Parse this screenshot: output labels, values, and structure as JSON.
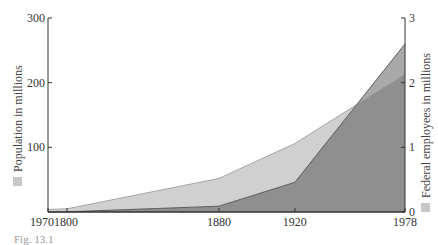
{
  "chart_data": {
    "type": "area",
    "title": "",
    "xlabel": "",
    "x_tick_labels": [
      "1970",
      "1800",
      "1880",
      "1920",
      "1978"
    ],
    "x": [
      1790,
      1800,
      1880,
      1920,
      1978
    ],
    "xlim": [
      1790,
      1978
    ],
    "y_left": {
      "label": "Population in millions",
      "ticks": [
        0,
        100,
        200,
        300
      ],
      "tick_labels": [
        "",
        "100",
        "200",
        "300"
      ],
      "ylim": [
        0,
        300
      ]
    },
    "y_right": {
      "label": "Federal employees in millions",
      "ticks": [
        0,
        1,
        2,
        3
      ],
      "tick_labels": [
        "0",
        "1",
        "2",
        "3"
      ],
      "ylim": [
        0,
        3
      ]
    },
    "series": [
      {
        "name": "Population in millions",
        "axis": "left",
        "values": [
          4,
          5,
          52,
          106,
          213
        ],
        "color": "#d0d0d0"
      },
      {
        "name": "Federal employees in millions",
        "axis": "right",
        "values": [
          0.0,
          0.003,
          0.09,
          0.46,
          2.6
        ],
        "color": "#8f8f8f"
      }
    ],
    "overlap_color": "#a9a9a9",
    "grid": false,
    "legend_position": "rotated axis titles with swatches"
  },
  "caption": "Fig. 13.1"
}
